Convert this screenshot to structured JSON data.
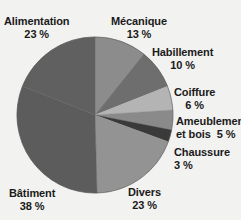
{
  "chart_data": {
    "type": "pie",
    "title": "",
    "subtitle": "",
    "xlabel": "",
    "ylabel": "",
    "legend_position": "none",
    "grid": false,
    "value_suffix": "%",
    "start_angle_deg": 0,
    "direction": "clockwise",
    "categories": [
      "Mécanique",
      "Habillement",
      "Coiffure",
      "Ameublement et bois",
      "Chaussure",
      "Divers",
      "Bâtiment",
      "Alimentation"
    ],
    "values": [
      13,
      10,
      6,
      5,
      3,
      23,
      38,
      23
    ],
    "colors": [
      "#8c8c8c",
      "#6e6e6e",
      "#b4b4b4",
      "#8a8a8a",
      "#3a3a3a",
      "#939393",
      "#5c5c5c",
      "#606060"
    ],
    "slices": [
      {
        "name": "Mécanique",
        "value": 13,
        "value_label": "13 %",
        "color": "#8c8c8c"
      },
      {
        "name": "Habillement",
        "value": 10,
        "value_label": "10 %",
        "color": "#6e6e6e"
      },
      {
        "name": "Coiffure",
        "value": 6,
        "value_label": "6 %",
        "color": "#b4b4b4"
      },
      {
        "name": "Ameublement et bois",
        "value": 5,
        "value_label": "5 %",
        "color": "#8a8a8a"
      },
      {
        "name": "Chaussure",
        "value": 3,
        "value_label": "3 %",
        "color": "#3a3a3a"
      },
      {
        "name": "Divers",
        "value": 23,
        "value_label": "23 %",
        "color": "#939393"
      },
      {
        "name": "Bâtiment",
        "value": 38,
        "value_label": "38 %",
        "color": "#5c5c5c"
      },
      {
        "name": "Alimentation",
        "value": 23,
        "value_label": "23 %",
        "color": "#606060"
      }
    ]
  },
  "labels": {
    "alimentation": {
      "name": "Alimentation",
      "pct": "23 %"
    },
    "mecanique": {
      "name": "Mécanique",
      "pct": "13 %"
    },
    "habillement": {
      "name": "Habillement",
      "pct": "10 %"
    },
    "coiffure": {
      "name": "Coiffure",
      "pct": "6 %"
    },
    "ameublement": {
      "name": "Ameublement",
      "line2": "et bois",
      "pct": "5 %"
    },
    "chaussure": {
      "name": "Chaussure",
      "pct": "3 %"
    },
    "divers": {
      "name": "Divers",
      "pct": "23 %"
    },
    "batiment": {
      "name": "Bâtiment",
      "pct": "38 %"
    }
  }
}
